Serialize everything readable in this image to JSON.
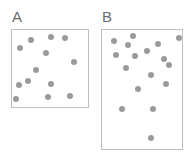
{
  "figure": {
    "width": 192,
    "height": 156,
    "background_color": "#ffffff",
    "type": "dot-density-comparison"
  },
  "style": {
    "panel_border_color": "#bfbfbf",
    "panel_border_width": 1,
    "panel_fill_color": "#ffffff",
    "dot_color": "#9a9a9a",
    "dot_diameter": 6,
    "label_color": "#6b6b6b",
    "label_font_size": 15
  },
  "panels": [
    {
      "id": "panel-a",
      "label": "A",
      "label_x": 12,
      "label_y": 9,
      "x": 11,
      "y": 29,
      "width": 78,
      "height": 79,
      "dot_count": 13,
      "dots": [
        {
          "cx": 20,
          "cy": 48
        },
        {
          "cx": 31,
          "cy": 40
        },
        {
          "cx": 51,
          "cy": 37
        },
        {
          "cx": 65,
          "cy": 38
        },
        {
          "cx": 46,
          "cy": 53
        },
        {
          "cx": 74,
          "cy": 62
        },
        {
          "cx": 36,
          "cy": 70
        },
        {
          "cx": 28,
          "cy": 81
        },
        {
          "cx": 19,
          "cy": 85
        },
        {
          "cx": 51,
          "cy": 84
        },
        {
          "cx": 48,
          "cy": 97
        },
        {
          "cx": 70,
          "cy": 96
        },
        {
          "cx": 16,
          "cy": 99
        }
      ]
    },
    {
      "id": "panel-b",
      "label": "B",
      "label_x": 102,
      "label_y": 9,
      "x": 101,
      "y": 29,
      "width": 82,
      "height": 121,
      "dot_count": 17,
      "dots": [
        {
          "cx": 114,
          "cy": 41
        },
        {
          "cx": 133,
          "cy": 36
        },
        {
          "cx": 128,
          "cy": 45
        },
        {
          "cx": 158,
          "cy": 44
        },
        {
          "cx": 179,
          "cy": 38
        },
        {
          "cx": 116,
          "cy": 55
        },
        {
          "cx": 135,
          "cy": 56
        },
        {
          "cx": 147,
          "cy": 51
        },
        {
          "cx": 164,
          "cy": 59
        },
        {
          "cx": 126,
          "cy": 68
        },
        {
          "cx": 151,
          "cy": 75
        },
        {
          "cx": 166,
          "cy": 84
        },
        {
          "cx": 138,
          "cy": 89
        },
        {
          "cx": 122,
          "cy": 109
        },
        {
          "cx": 153,
          "cy": 109
        },
        {
          "cx": 151,
          "cy": 138
        },
        {
          "cx": 169,
          "cy": 65
        }
      ]
    }
  ]
}
